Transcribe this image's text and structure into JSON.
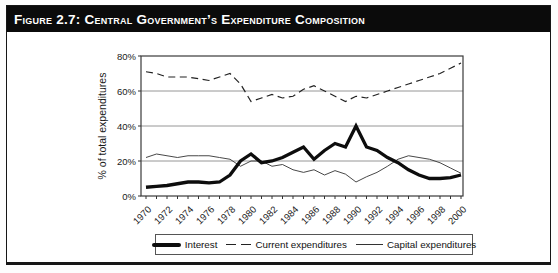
{
  "figure": {
    "title": "Figure 2.7:  Central Government’s Expenditure Composition"
  },
  "colors": {
    "title_bar_bg": "#0b0b0b",
    "title_bar_text": "#ffffff",
    "line_color": "#0d0d0d",
    "grid_color": "#8a8a8a",
    "frame_border": "#161616"
  },
  "chart_data": {
    "type": "line",
    "title": "",
    "xlabel": "",
    "ylabel": "% of total expenditures",
    "ylim": [
      0,
      80
    ],
    "yticks": [
      0,
      20,
      40,
      60,
      80
    ],
    "ytick_suffix": "%",
    "grid": true,
    "legend_position": "bottom",
    "x": [
      1970,
      1971,
      1972,
      1973,
      1974,
      1975,
      1976,
      1977,
      1978,
      1979,
      1980,
      1981,
      1982,
      1983,
      1984,
      1985,
      1986,
      1987,
      1988,
      1989,
      1990,
      1991,
      1992,
      1993,
      1994,
      1995,
      1996,
      1997,
      1998,
      1999,
      2000
    ],
    "xtick_labels": [
      1970,
      1972,
      1974,
      1976,
      1978,
      1980,
      1982,
      1984,
      1986,
      1988,
      1990,
      1992,
      1994,
      1996,
      1998,
      2000
    ],
    "series": [
      {
        "name": "Interest",
        "style": "thick-solid",
        "values": [
          5,
          5.5,
          6,
          7,
          8,
          8,
          7.5,
          8,
          12,
          20,
          24,
          19,
          20,
          22,
          25,
          28,
          21,
          26,
          30,
          28,
          40,
          28,
          26,
          22,
          19,
          15,
          12,
          10,
          10,
          10.5,
          12
        ]
      },
      {
        "name": "Current expenditures",
        "style": "dashed",
        "values": [
          71,
          70,
          68,
          68,
          68,
          67,
          66,
          68,
          70,
          64,
          54,
          56,
          58,
          56,
          57,
          61,
          63,
          60,
          57,
          54,
          57,
          56,
          58,
          60,
          62,
          64,
          66,
          68,
          70,
          73,
          76
        ]
      },
      {
        "name": "Capital expenditures",
        "style": "thin-solid",
        "values": [
          22,
          24,
          23,
          22,
          23,
          23,
          23,
          22,
          21,
          17,
          20,
          20,
          17,
          18,
          15,
          13.5,
          15,
          12,
          14.5,
          12.5,
          8,
          11,
          13.5,
          17,
          21,
          23,
          22,
          21,
          19,
          16,
          13
        ]
      }
    ]
  }
}
